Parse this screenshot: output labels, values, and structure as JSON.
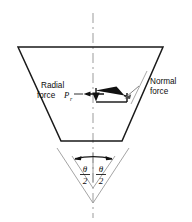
{
  "figure": {
    "background_color": "#ffffff",
    "line_color": "#1a1a1a",
    "centerline_color": "#a8a8a8",
    "guide_color": "#9a9a9a"
  },
  "labels": {
    "radial_line1": "Radial",
    "radial_line2": "force",
    "radial_symbol": "P",
    "radial_subscript": "r",
    "normal_line1": "Normal",
    "normal_line2": "force",
    "theta_symbol": "θ",
    "theta_denominator": "2"
  },
  "geometry": {
    "trapezoid": {
      "top_left_x": 18,
      "top_right_x": 163,
      "top_y": 47,
      "bottom_left_x": 61,
      "bottom_right_x": 122,
      "bottom_y": 141
    },
    "centerline": {
      "x": 93,
      "y_start": 13,
      "y_end": 218
    },
    "apex": {
      "x": 93,
      "y": 203
    },
    "angle_dimension": {
      "left_x": 75,
      "right_x": 112,
      "y": 157
    }
  },
  "annotations": {
    "groove_half_angle": "θ/2",
    "forces": [
      {
        "name": "radial-force",
        "direction": "horizontal-left"
      },
      {
        "name": "normal-force",
        "direction": "perpendicular-to-groove-face"
      }
    ]
  }
}
